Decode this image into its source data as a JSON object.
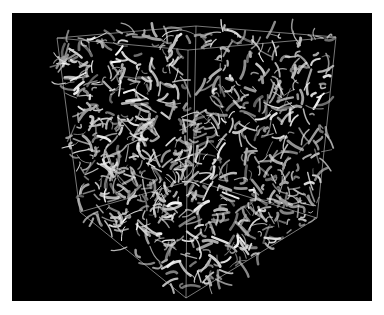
{
  "figure": {
    "background_color": "#000000",
    "page_color": "#ffffff",
    "panel": {
      "x": 12,
      "y": 13,
      "width": 360,
      "height": 288
    },
    "tube_color": "#e6e6e6",
    "edge_color": "#bdbdbd",
    "cube_vertices": {
      "top_back": [
        196,
        26
      ],
      "top_left": [
        57,
        38
      ],
      "top_right": [
        336,
        37
      ],
      "center": [
        188,
        50
      ],
      "bottom_left": [
        80,
        212
      ],
      "bottom_right": [
        317,
        218
      ],
      "bottom_front": [
        186,
        298
      ],
      "bottom_back": [
        193,
        180
      ]
    },
    "tube_count": 900,
    "seed": 17
  }
}
